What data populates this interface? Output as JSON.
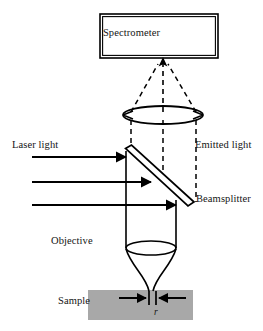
{
  "figure": {
    "background_color": "#ffffff",
    "line_color": "#000000",
    "text_color": "#141414",
    "sample_fill_color": "#a8a8a8",
    "width": 263,
    "height": 331
  },
  "labels": {
    "spectrometer": "Spectrometer",
    "laser_light": "Laser light",
    "emitted_light": "Emitted light",
    "beamsplitter": "Beamsplitter",
    "objective": "Objective",
    "sample": "Sample",
    "radius": "r"
  },
  "components": {
    "spectrometer_box": {
      "name": "Spectrometer",
      "x": 100,
      "y": 14,
      "width": 118,
      "height": 44,
      "border": "double"
    },
    "collection_lens": {
      "name": "Collection lens",
      "center_x": 163,
      "center_y": 115,
      "rx": 40,
      "ry": 9
    },
    "beamsplitter": {
      "name": "Beamsplitter",
      "angle_deg": 45,
      "x1": 127,
      "y1": 150,
      "x2": 191,
      "y2": 207,
      "thickness": 7
    },
    "objective_lens": {
      "name": "Objective",
      "center_x": 151,
      "center_y": 248,
      "rx": 25,
      "ry": 7
    },
    "sample_block": {
      "name": "Sample",
      "x": 88,
      "y": 290,
      "width": 105,
      "height": 30,
      "fill": "#a8a8a8"
    }
  },
  "beams": {
    "laser_rays": {
      "style": "solid",
      "direction": "rightward",
      "count": 3,
      "x_start": 32,
      "y_positions": [
        157,
        182,
        205
      ],
      "arrowhead": "filled-triangle"
    },
    "emitted_rays": {
      "style": "dashed",
      "direction": "upward",
      "description": "Dashed rays collected above beamsplitter, converging through collection lens into spectrometer",
      "vertical_dashed_x": [
        131,
        163,
        196
      ],
      "converge_to_x": 163,
      "converge_to_y": 60
    },
    "beam_tube": {
      "style": "solid",
      "left_x": 126,
      "right_x": 176,
      "top_y": 150,
      "bottom_y": 248
    },
    "focused_beam": {
      "style": "solid",
      "focus_x": 151,
      "focus_y": 291,
      "description": "Beam converging from objective to focal spot on sample surface"
    }
  },
  "annotations": {
    "spot_size_marker": {
      "label": "r",
      "description": "Inward-pointing arrows marking the focal spot diameter on the sample surface",
      "left_arrow_x_start": 118,
      "left_arrow_x_end": 147,
      "right_arrow_x_start": 185,
      "right_arrow_x_end": 157,
      "y": 298,
      "tick_x": [
        149,
        155
      ],
      "tick_top": 291,
      "tick_bottom": 305
    }
  }
}
